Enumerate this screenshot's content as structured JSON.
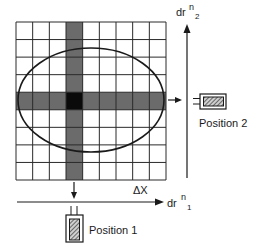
{
  "diagram": {
    "grid": {
      "columns": 9,
      "rows": 9,
      "highlighted_row_index": 4,
      "highlighted_column_index": 3,
      "band_color": "#6b6b6b",
      "center_color": "#0a0a0a",
      "line_color": "#2a2a2a"
    },
    "ellipse": {
      "stroke": "#1a1a1a"
    },
    "labels": {
      "delta_x": "ΔX",
      "axis_horizontal_base": "dr",
      "axis_horizontal_sup": "n",
      "axis_horizontal_sub": "1",
      "axis_vertical_base": "dr",
      "axis_vertical_sup": "n",
      "axis_vertical_sub": "2",
      "position_1": "Position 1",
      "position_2": "Position 2"
    },
    "icons": {
      "detector_1": "detector-icon",
      "detector_2": "detector-icon",
      "arrow_down": "arrow-down-icon",
      "arrow_right": "arrow-right-icon"
    }
  }
}
